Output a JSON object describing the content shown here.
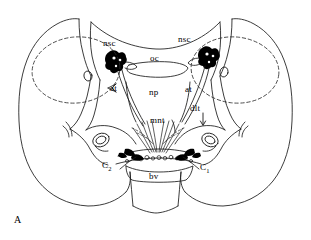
{
  "figure": {
    "panel_label": "A",
    "ink_color": "#000000",
    "background_color": "#ffffff",
    "line_color": "#1a1a1a",
    "dash_color": "#2b2b2b"
  },
  "labels": {
    "nsc_left": "nsc",
    "nsc_right": "nsc",
    "oc": "oc",
    "at_left": "at",
    "at_right": "at",
    "np": "np",
    "dlt": "dlt",
    "mnt": "mnt",
    "bv": "bv",
    "c2_main": "C",
    "c2_sub": "2",
    "c1_main": "C",
    "c1_sub": "1"
  }
}
